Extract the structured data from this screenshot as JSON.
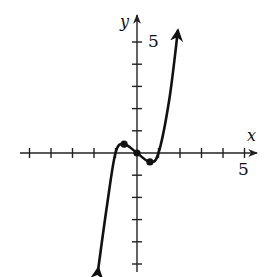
{
  "chart_data": {
    "type": "line",
    "title": "",
    "xlabel": "x",
    "ylabel": "y",
    "xlim": [
      -5.5,
      5.5
    ],
    "ylim": [
      -5.5,
      6
    ],
    "x_tick_step": 1,
    "y_tick_step": 1,
    "x_tick_label": "5",
    "y_tick_label": "5",
    "grid": false,
    "series": [
      {
        "name": "cubic curve",
        "shape": "cubic, increasing end behavior, arrows at both ends",
        "points": [
          {
            "x": -1.8,
            "y": -5.2
          },
          {
            "x": -1.4,
            "y": -2.4
          },
          {
            "x": -1.0,
            "y": 0.0
          },
          {
            "x": -0.6,
            "y": 0.4
          },
          {
            "x": 0.0,
            "y": 0.0
          },
          {
            "x": 0.6,
            "y": -0.4
          },
          {
            "x": 1.0,
            "y": 0.0
          },
          {
            "x": 1.5,
            "y": 2.4
          },
          {
            "x": 1.9,
            "y": 5.5
          }
        ],
        "marked_points": [
          {
            "x": -0.6,
            "y": 0.4,
            "label": "local maximum"
          },
          {
            "x": 0.0,
            "y": 0.0,
            "label": "origin"
          },
          {
            "x": 0.6,
            "y": -0.4,
            "label": "local minimum"
          }
        ]
      }
    ]
  },
  "labels": {
    "x_axis": "x",
    "y_axis": "y",
    "x_tick": "5",
    "y_tick": "5"
  },
  "colors": {
    "axis": "#222222",
    "curve": "#111111",
    "background": "#ffffff"
  }
}
